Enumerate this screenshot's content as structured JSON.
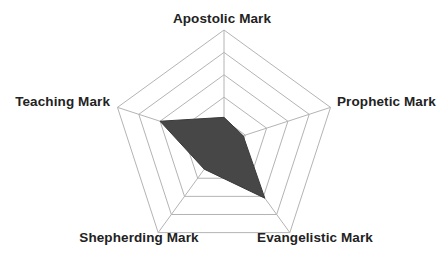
{
  "chart_data": {
    "type": "radar",
    "title": "",
    "subtitle": "",
    "xlabel": "",
    "ylabel": "",
    "grid": true,
    "grid_shape": "pentagon",
    "rings": 5,
    "legend_position": "none",
    "axis_range": [
      0,
      5
    ],
    "categories": [
      "Apostolic Mark",
      "Prophetic Mark",
      "Evangelistic Mark",
      "Shepherding Mark",
      "Teaching Mark"
    ],
    "series": [
      {
        "name": "Fivefold Ministry Profile",
        "values": [
          1.1,
          0.9,
          3.1,
          1.5,
          3.0
        ]
      }
    ],
    "colors": {
      "fill": "#474747",
      "stroke": "#3a3a3a",
      "grid": "#b4b4b4",
      "spoke": "#b4b4b4",
      "label": "#222222",
      "background": "#ffffff"
    }
  },
  "labels": {
    "apostolic": "Apostolic Mark",
    "prophetic": "Prophetic Mark",
    "evangelistic": "Evangelistic Mark",
    "shepherding": "Shepherding Mark",
    "teaching": "Teaching Mark"
  }
}
